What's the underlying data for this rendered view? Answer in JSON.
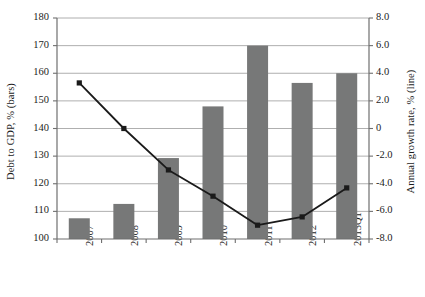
{
  "chart_data": {
    "type": "bar",
    "title": "",
    "subtitle": "",
    "xlabel": "",
    "ylabel": "Debt to GDP, % (bars)",
    "y2label": "Annual growth rate, % (line)",
    "categories": [
      "2007",
      "2008",
      "2009",
      "2010",
      "2011",
      "2012",
      "2013Q1"
    ],
    "series": [
      {
        "name": "Debt to GDP, % (bars)",
        "type": "bar",
        "axis": "left",
        "color": "#777878",
        "values": [
          107.5,
          112.7,
          129.3,
          148.0,
          170.0,
          156.5,
          160.0
        ]
      },
      {
        "name": "Annual growth rate, % (line)",
        "type": "line",
        "axis": "right",
        "color": "#1a1a1a",
        "marker": "square",
        "values": [
          3.3,
          0.0,
          -3.0,
          -4.9,
          -7.0,
          -6.4,
          -4.3
        ]
      }
    ],
    "ylim": [
      100,
      180
    ],
    "y2lim": [
      -8.0,
      8.0
    ],
    "ytick_labels": [
      "180",
      "170",
      "160",
      "150",
      "140",
      "130",
      "120",
      "110",
      "100"
    ],
    "ytick_values": [
      180,
      170,
      160,
      150,
      140,
      130,
      120,
      110,
      100
    ],
    "y2tick_labels": [
      "8.0",
      "6.0",
      "4.0",
      "2.0",
      "0",
      "-2.0",
      "-4.0",
      "-6.0",
      "-8.0"
    ],
    "y2tick_values": [
      8.0,
      6.0,
      4.0,
      2.0,
      0,
      -2.0,
      -4.0,
      -6.0,
      -8.0
    ],
    "grid": true,
    "grid_axis": "y-left",
    "grid_color": "#9a9a9a",
    "legend": "none",
    "background": "#ffffff"
  }
}
